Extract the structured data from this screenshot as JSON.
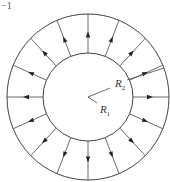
{
  "figure": {
    "corner_text": "−1",
    "center": [
      88,
      97
    ],
    "outer_radius": [
      81,
      83
    ],
    "inner_radius": [
      45,
      44
    ],
    "arrow_count": 16,
    "arrow_direction": "radially outward",
    "labels": {
      "r2": {
        "main": "R",
        "sub": "2"
      },
      "r1": {
        "main": "R",
        "sub": "1"
      }
    },
    "stroke_color": "#444444"
  }
}
